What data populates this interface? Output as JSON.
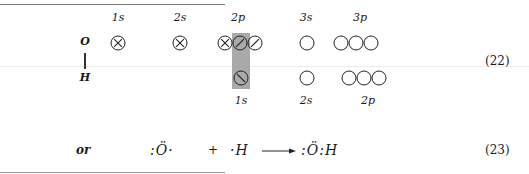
{
  "figure": {
    "atoms": {
      "top": "O",
      "bottom": "H"
    },
    "upper_labels": [
      "1s",
      "2s",
      "2p",
      "3s",
      "3p"
    ],
    "lower_labels": [
      "1s",
      "2s",
      "2p"
    ],
    "upper_orbitals": [
      {
        "label": "1s",
        "state": "paired"
      },
      {
        "label": "2s",
        "state": "paired"
      },
      {
        "label": "2p-1",
        "state": "paired"
      },
      {
        "label": "2p-2",
        "state": "single"
      },
      {
        "label": "2p-3",
        "state": "single"
      },
      {
        "label": "3s",
        "state": "empty"
      },
      {
        "label": "3p-1",
        "state": "empty"
      },
      {
        "label": "3p-2",
        "state": "empty"
      },
      {
        "label": "3p-3",
        "state": "empty"
      }
    ],
    "lower_orbitals": [
      {
        "label": "1s",
        "state": "single"
      },
      {
        "label": "2s",
        "state": "empty"
      },
      {
        "label": "2p-1",
        "state": "empty"
      },
      {
        "label": "2p-2",
        "state": "empty"
      },
      {
        "label": "2p-3",
        "state": "empty"
      }
    ],
    "shading_color": "#a9a9a9",
    "equation_number": "(22)"
  },
  "equation": {
    "prefix": "or",
    "reactant1": ":Ö·",
    "plus": "+",
    "reactant2": "·H",
    "product": ":Ö:H",
    "equation_number": "(23)"
  }
}
